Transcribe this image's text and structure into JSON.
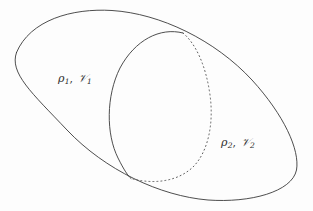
{
  "figure": {
    "type": "venn-two-region-diagram",
    "width": 313,
    "height": 211,
    "background_color": "#fdfdfd",
    "stroke_color": "#3a3a3a",
    "stroke_width": 0.9
  },
  "labels": {
    "region_1": {
      "density_symbol": "ρ",
      "density_subscript": "1",
      "separator": ", ",
      "volume_symbol": "𝒱",
      "volume_subscript": "1",
      "full_text": "ρ1, 𝒱1",
      "x": 58,
      "y": 72
    },
    "region_2": {
      "density_symbol": "ρ",
      "density_subscript": "2",
      "separator": ", ",
      "volume_symbol": "𝒱",
      "volume_subscript": "2",
      "full_text": "ρ2, 𝒱2",
      "x": 221,
      "y": 136
    }
  },
  "shapes": {
    "outer_ellipse": {
      "name": "outer-region-boundary",
      "style": "solid",
      "center_x": 156,
      "center_y": 105,
      "radius_x": 148,
      "radius_y": 70,
      "rotation_deg": 36,
      "path": "M 16.5,52.5 C 30,20 72,8 112,10.5 C 160,13.5 215,40 252,80 C 284,115 300,150 296.5,170 C 292,192 250,203 208,200 C 160,196 105,170 67,130 C 32,93 9,73 16.5,52.5 Z"
    },
    "inner_ellipse_solid_arc": {
      "name": "inner-region-solid-arc",
      "style": "solid",
      "path": "M 183,33 C 160,27 135,40 120,68 C 106,96 106,134 118,158 C 124,170 128,176 131,178.5"
    },
    "inner_ellipse_dotted_arc": {
      "name": "inner-region-dotted-arc",
      "style": "dotted",
      "dash_pattern": "1,3",
      "path": "M 183,33 C 196,44 206,66 210,95 C 214,124 208,152 193,167 C 176,183 151,184 131,178.5"
    },
    "intersection_points": [
      {
        "name": "upper-intersection",
        "x": 183,
        "y": 33
      },
      {
        "name": "lower-intersection",
        "x": 131,
        "y": 178.5
      }
    ]
  }
}
